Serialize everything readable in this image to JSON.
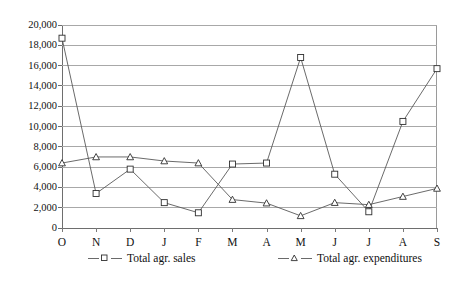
{
  "chart_data": {
    "type": "line",
    "title": "",
    "subtitle": "",
    "xlabel": "",
    "ylabel": "",
    "categories": [
      "O",
      "N",
      "D",
      "J",
      "F",
      "M",
      "A",
      "M",
      "J",
      "J",
      "A",
      "S"
    ],
    "ylim": [
      0,
      20000
    ],
    "yticks": [
      0,
      2000,
      4000,
      6000,
      8000,
      10000,
      12000,
      14000,
      16000,
      18000,
      20000
    ],
    "ytick_labels": [
      "0",
      "2,000",
      "4,000",
      "6,000",
      "8,000",
      "10,000",
      "12,000",
      "14,000",
      "16,000",
      "18,000",
      "20,000"
    ],
    "grid": true,
    "legend_position": "bottom",
    "series": [
      {
        "name": "Total agr. sales",
        "marker": "square",
        "values": [
          18700,
          3400,
          5800,
          2500,
          1500,
          6300,
          6400,
          16800,
          5300,
          1600,
          10500,
          15700
        ]
      },
      {
        "name": "Total agr. expenditures",
        "marker": "triangle",
        "values": [
          6400,
          7000,
          7000,
          6600,
          6400,
          2800,
          2450,
          1200,
          2500,
          2300,
          3100,
          3900
        ]
      }
    ]
  },
  "legend": {
    "sales_label": "Total agr. sales",
    "expenditures_label": "Total agr. expenditures"
  },
  "colors": {
    "line": "#595959",
    "grid": "#a8a8a8",
    "axis": "#6e6e6e",
    "marker_fill": "#ffffff",
    "marker_stroke": "#2f2f2f",
    "text": "#111111",
    "background": "#ffffff"
  }
}
